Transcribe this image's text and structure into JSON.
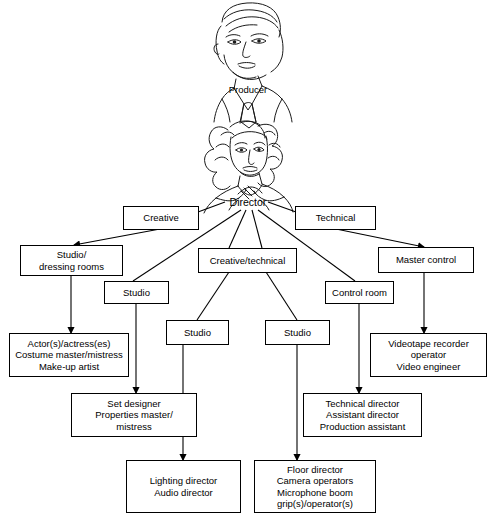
{
  "diagram": {
    "type": "hierarchy-tree",
    "line_color": "#000000",
    "box_fill": "#ffffff"
  },
  "illustrations": [
    {
      "name": "producer-portrait",
      "subject": "man face line drawing",
      "caption": "Producer"
    },
    {
      "name": "director-portrait",
      "subject": "woman face line drawing with headset",
      "caption": "Director"
    }
  ],
  "nodes": {
    "producer_caption": "Producer",
    "director_label": "Director",
    "creative": "Creative",
    "technical": "Technical",
    "studio_dressing_rooms": "Studio/\ndressing rooms",
    "creative_technical": "Creative/technical",
    "master_control": "Master control",
    "studio_a": "Studio",
    "studio_b": "Studio",
    "studio_c": "Studio",
    "control_room": "Control room",
    "talent_leaf": "Actor(s)/actress(es)\nCostume master/mistress\nMake-up artist",
    "design_leaf": "Set designer\nProperties master/\nmistress",
    "videotape_leaf": "Videotape recorder\noperator\nVideo engineer",
    "technical_leaf": "Technical director\nAssistant director\nProduction assistant",
    "lighting_leaf": "Lighting director\nAudio director",
    "floor_leaf": "Floor director\nCamera operators\nMicrophone boom\ngrip(s)/operator(s)"
  }
}
